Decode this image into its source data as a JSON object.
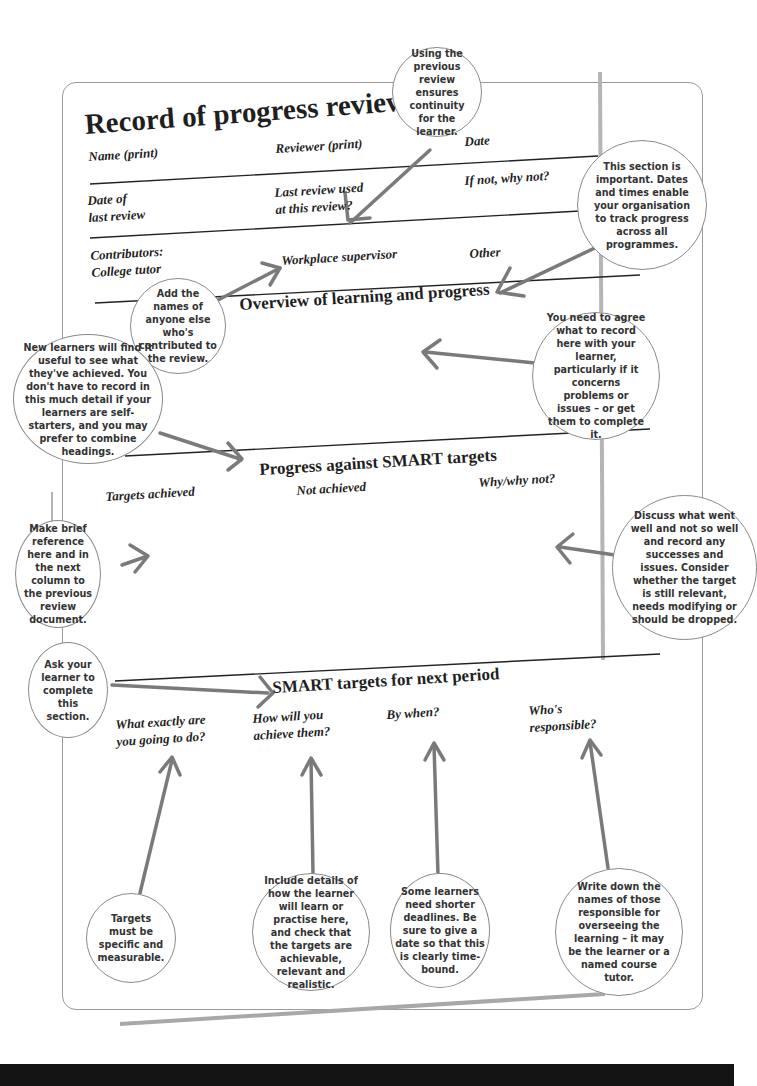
{
  "form": {
    "title": "Record of progress review",
    "fields": {
      "name": "Name (print)",
      "reviewer": "Reviewer (print)",
      "date": "Date",
      "date_last_review": "Date of\nlast review",
      "last_review_used": "Last review used\nat this review?",
      "if_not": "If not, why not?",
      "contributors": "Contributors:\nCollege tutor",
      "workplace_supervisor": "Workplace supervisor",
      "other": "Other"
    },
    "sections": {
      "overview": "Overview of learning and progress",
      "progress": "Progress against SMART targets",
      "next_period": "SMART targets for next period"
    },
    "progress_columns": [
      "Targets achieved",
      "Not achieved",
      "Why/why not?"
    ],
    "next_columns": [
      "What exactly are\nyou going to do?",
      "How will you\nachieve them?",
      "By when?",
      "Who's\nresponsible?"
    ]
  },
  "callouts": [
    {
      "id": "previous-review",
      "text": "Using the previous review ensures continuity for the learner."
    },
    {
      "id": "section-important",
      "text": "This section is important. Dates and times enable your organisation to track progress across all programmes."
    },
    {
      "id": "add-names",
      "text": "Add the names of anyone else who's contributed to the review."
    },
    {
      "id": "new-learners",
      "text": "New learners will find it useful to see what they've achieved. You don't have to record in this much detail if your learners are self-starters, and you may prefer to combine headings."
    },
    {
      "id": "agree-record",
      "text": "You need to agree what to record here with your learner, particularly if it concerns problems or issues – or get them to complete it."
    },
    {
      "id": "brief-reference",
      "text": "Make brief reference here and in the next column to the previous review document."
    },
    {
      "id": "discuss",
      "text": "Discuss what went well and not so well and record any successes and issues. Consider whether the target is still relevant, needs modifying or should be dropped."
    },
    {
      "id": "ask-learner",
      "text": "Ask your learner to complete this section."
    },
    {
      "id": "specific",
      "text": "Targets must be specific and measurable."
    },
    {
      "id": "include-details",
      "text": "Include details of how the learner will learn or practise here, and check that the targets are achievable, relevant and realistic."
    },
    {
      "id": "deadlines",
      "text": "Some learners need shorter deadlines. Be sure to give a date so that this is clearly time-bound."
    },
    {
      "id": "responsible",
      "text": "Write down the names of those responsible for overseeing the learning – it may be the learner or a named course tutor."
    }
  ],
  "colors": {
    "line": "#222222",
    "arrow": "#7a7a7a",
    "bubble_border": "#8a8a8a",
    "text": "#1f1f1f"
  }
}
